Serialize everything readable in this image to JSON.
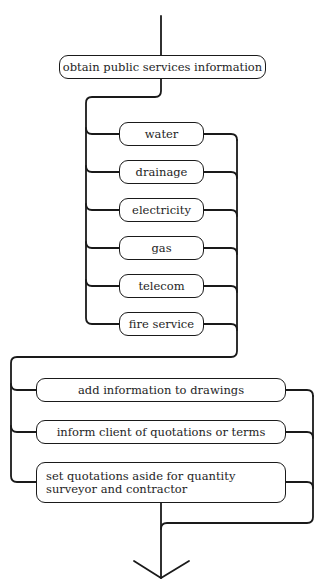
{
  "diagram": {
    "type": "flowchart",
    "start_box": {
      "label": "obtain public services information"
    },
    "services": [
      {
        "label": "water"
      },
      {
        "label": "drainage"
      },
      {
        "label": "electricity"
      },
      {
        "label": "gas"
      },
      {
        "label": "telecom"
      },
      {
        "label": "fire service"
      }
    ],
    "actions": [
      {
        "label": "add information to drawings"
      },
      {
        "label": "inform client of quotations or terms"
      },
      {
        "label": "set quotations aside for quantity surveyor and contractor"
      }
    ],
    "end": {
      "symbol": "down-arrow"
    }
  }
}
